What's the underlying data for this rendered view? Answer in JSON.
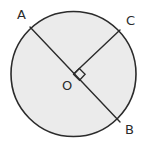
{
  "figure": {
    "kind": "circle-geometry-diagram",
    "canvas": {
      "width": 147,
      "height": 149
    },
    "background_color": "#ffffff",
    "circle": {
      "center_x": 73.5,
      "center_y": 74,
      "radius": 62.5,
      "fill_color": "#ebebeb",
      "stroke_color": "#2b2b2b",
      "stroke_width": 1.6
    },
    "segments": [
      {
        "name": "diameter-AB",
        "from": "A",
        "to": "B",
        "x1": 30,
        "y1": 27,
        "x2": 120,
        "y2": 122
      },
      {
        "name": "radius-OC",
        "from": "O",
        "to": "C",
        "x1": 73.5,
        "y1": 74,
        "x2": 120,
        "y2": 30
      }
    ],
    "right_angle_mark": {
      "present": true,
      "at": "O",
      "between": "OC and OB",
      "size": 8
    },
    "labels": {
      "a": "A",
      "c": "C",
      "o": "O",
      "b": "B"
    },
    "label_color": "#2b2b2b"
  }
}
